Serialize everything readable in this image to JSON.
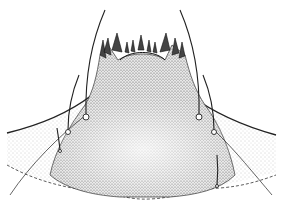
{
  "figure": {
    "colors": {
      "background": "#ffffff",
      "ink": "#222222",
      "stipple_light": "#bdbdbd",
      "stipple_dark": "#6e6e6e"
    },
    "setae_count": 6,
    "teeth_count": 11
  }
}
